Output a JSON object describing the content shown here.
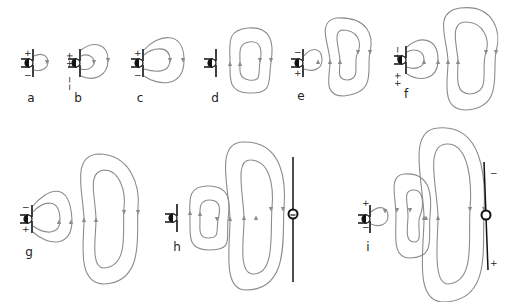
{
  "figure": {
    "colors": {
      "field_line": "#8c8c8c",
      "ink": "#111111",
      "background": "#ffffff"
    }
  },
  "panels": [
    {
      "id": "a",
      "label": "a",
      "source_signs": {
        "top": "+",
        "bottom": "−"
      }
    },
    {
      "id": "b",
      "label": "b",
      "source_signs": {
        "top": "++",
        "bottom": "−−"
      }
    },
    {
      "id": "c",
      "label": "c",
      "source_signs": {
        "top": "+",
        "bottom": "−"
      }
    },
    {
      "id": "d",
      "label": "d",
      "source_signs": {
        "top": "",
        "bottom": ""
      }
    },
    {
      "id": "e",
      "label": "e",
      "source_signs": {
        "top": "−",
        "bottom": "+"
      }
    },
    {
      "id": "f",
      "label": "f",
      "source_signs": {
        "top": "−−",
        "bottom": "++"
      }
    },
    {
      "id": "g",
      "label": "g",
      "source_signs": {
        "top": "−",
        "bottom": "+"
      }
    },
    {
      "id": "h",
      "label": "h",
      "source_signs": {
        "top": "",
        "bottom": ""
      },
      "receiver": {
        "signs": {
          "top": "",
          "bottom": ""
        }
      }
    },
    {
      "id": "i",
      "label": "i",
      "source_signs": {
        "top": "+",
        "bottom": "−"
      },
      "receiver": {
        "signs": {
          "top": "−",
          "bottom": "+"
        }
      }
    }
  ]
}
